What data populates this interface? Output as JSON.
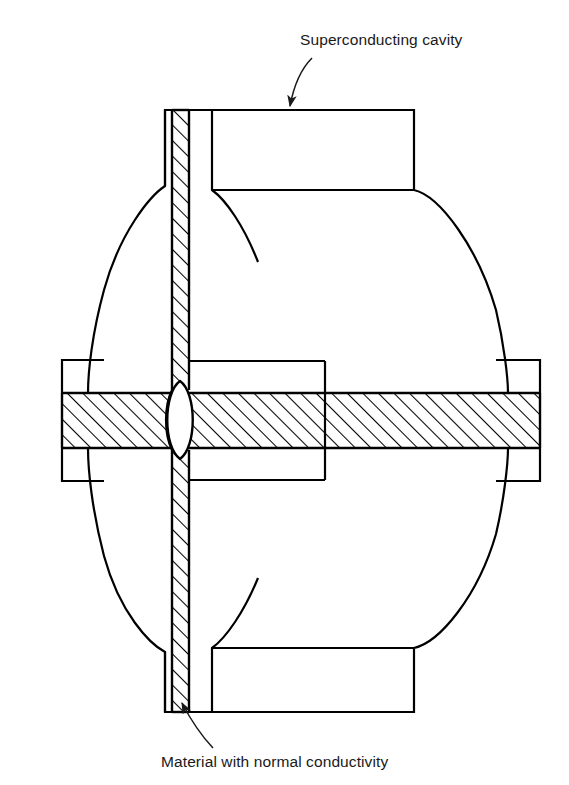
{
  "figure": {
    "type": "technical-cross-section-diagram",
    "background_color": "#ffffff",
    "line_color": "#000000",
    "hatch_color": "#000000"
  },
  "annotations": [
    {
      "id": "superconducting-cavity",
      "label": "Superconducting cavity",
      "text_x": 300,
      "text_y": 45,
      "anchor": "start",
      "leader": {
        "from_x": 312,
        "from_y": 58,
        "to_x": 289,
        "to_y": 107,
        "curve_x": 295,
        "curve_y": 72,
        "arrow": "end"
      }
    },
    {
      "id": "material-normal-conductivity",
      "label": "Material with normal conductivity",
      "text_x": 161,
      "text_y": 767,
      "anchor": "start",
      "leader": {
        "from_x": 213,
        "from_y": 748,
        "to_x": 180,
        "to_y": 700,
        "curve_x": 190,
        "curve_y": 728,
        "arrow": "end"
      }
    }
  ],
  "geometry": {
    "cavity": {
      "name": "superconducting-cavity-body",
      "axis_x": 180,
      "top_neck": {
        "left": 165,
        "right": 414,
        "top": 110,
        "bottom": 190
      },
      "bottom_neck": {
        "left": 165,
        "right": 414,
        "top": 648,
        "bottom": 712
      },
      "bulge_left_extent": 62,
      "bulge_right_extent": 508,
      "waist_y": 420,
      "inner_wall_right_x": 325
    },
    "septum": {
      "name": "normal-conductivity-septum",
      "x_left": 172,
      "x_right": 189,
      "y_top": 110,
      "y_bottom": 712,
      "hatch": "diagonal-45"
    },
    "horizontal_bar": {
      "name": "horizontal-conductor-bar",
      "x_left": 62,
      "x_right": 540,
      "y_top": 393,
      "y_bottom": 448,
      "hatch": "diagonal-45"
    },
    "lens": {
      "name": "central-lens-aperture",
      "cx": 180,
      "cy": 420,
      "rx": 14,
      "ry": 38,
      "fill": "#ffffff"
    }
  }
}
